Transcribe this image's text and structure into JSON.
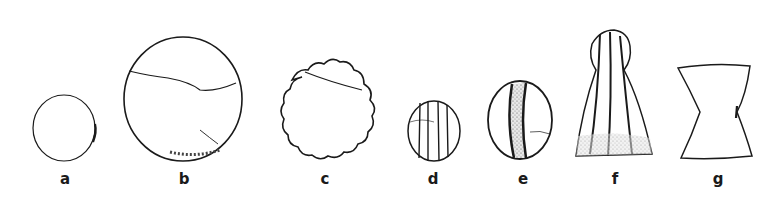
{
  "figure": {
    "ink_color": "#1a1a1a",
    "background": "#ffffff",
    "objects": [
      {
        "label": "a",
        "shape": "small-disc"
      },
      {
        "label": "b",
        "shape": "large-disc-cracked"
      },
      {
        "label": "c",
        "shape": "scalloped-disc"
      },
      {
        "label": "d",
        "shape": "small-ribbed-oval"
      },
      {
        "label": "e",
        "shape": "oval-with-dark-central-band"
      },
      {
        "label": "f",
        "shape": "bell-shaped-ribbed-pendant"
      },
      {
        "label": "g",
        "shape": "waisted-hourglass-tablet"
      }
    ]
  }
}
